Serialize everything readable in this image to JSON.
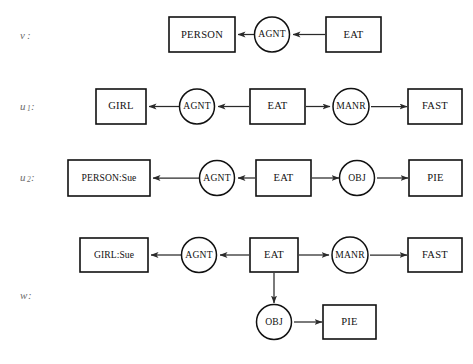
{
  "figure": {
    "background_color": "#ffffff",
    "stroke_color": "#111111",
    "text_color": "#111111",
    "label_color": "#6d6d6d",
    "width": 473,
    "height": 364
  },
  "rows": [
    {
      "id": "row-v",
      "label": "v",
      "label_sub": "",
      "label_colon": ":",
      "nodes": [
        {
          "id": "v-person",
          "shape": "box",
          "text": "PERSON"
        },
        {
          "id": "v-agnt",
          "shape": "circle",
          "text": "AGNT"
        },
        {
          "id": "v-eat",
          "shape": "box",
          "text": "EAT"
        }
      ],
      "edges": [
        {
          "from": "v-agnt",
          "to": "v-person",
          "direction": "left"
        },
        {
          "from": "v-eat",
          "to": "v-agnt",
          "direction": "left"
        }
      ]
    },
    {
      "id": "row-u1",
      "label": "u",
      "label_sub": "1",
      "label_colon": ":",
      "nodes": [
        {
          "id": "u1-girl",
          "shape": "box",
          "text": "GIRL"
        },
        {
          "id": "u1-agnt",
          "shape": "circle",
          "text": "AGNT"
        },
        {
          "id": "u1-eat",
          "shape": "box",
          "text": "EAT"
        },
        {
          "id": "u1-manr",
          "shape": "circle",
          "text": "MANR"
        },
        {
          "id": "u1-fast",
          "shape": "box",
          "text": "FAST"
        }
      ],
      "edges": [
        {
          "from": "u1-agnt",
          "to": "u1-girl",
          "direction": "left"
        },
        {
          "from": "u1-eat",
          "to": "u1-agnt",
          "direction": "left"
        },
        {
          "from": "u1-eat",
          "to": "u1-manr",
          "direction": "right"
        },
        {
          "from": "u1-manr",
          "to": "u1-fast",
          "direction": "right"
        }
      ]
    },
    {
      "id": "row-u2",
      "label": "u",
      "label_sub": "2",
      "label_colon": ":",
      "nodes": [
        {
          "id": "u2-person",
          "shape": "box",
          "text": "PERSON:Sue"
        },
        {
          "id": "u2-agnt",
          "shape": "circle",
          "text": "AGNT"
        },
        {
          "id": "u2-eat",
          "shape": "box",
          "text": "EAT"
        },
        {
          "id": "u2-obj",
          "shape": "circle",
          "text": "OBJ"
        },
        {
          "id": "u2-pie",
          "shape": "box",
          "text": "PIE"
        }
      ],
      "edges": [
        {
          "from": "u2-agnt",
          "to": "u2-person",
          "direction": "left"
        },
        {
          "from": "u2-eat",
          "to": "u2-agnt",
          "direction": "left"
        },
        {
          "from": "u2-eat",
          "to": "u2-obj",
          "direction": "right"
        },
        {
          "from": "u2-obj",
          "to": "u2-pie",
          "direction": "right"
        }
      ]
    },
    {
      "id": "row-w",
      "label": "w",
      "label_sub": "",
      "label_colon": ":",
      "nodes": [
        {
          "id": "w-girl",
          "shape": "box",
          "text": "GIRL:Sue"
        },
        {
          "id": "w-agnt",
          "shape": "circle",
          "text": "AGNT"
        },
        {
          "id": "w-eat",
          "shape": "box",
          "text": "EAT"
        },
        {
          "id": "w-manr",
          "shape": "circle",
          "text": "MANR"
        },
        {
          "id": "w-fast",
          "shape": "box",
          "text": "FAST"
        },
        {
          "id": "w-obj",
          "shape": "circle",
          "text": "OBJ"
        },
        {
          "id": "w-pie",
          "shape": "box",
          "text": "PIE"
        }
      ],
      "edges": [
        {
          "from": "w-agnt",
          "to": "w-girl",
          "direction": "left"
        },
        {
          "from": "w-eat",
          "to": "w-agnt",
          "direction": "left"
        },
        {
          "from": "w-eat",
          "to": "w-manr",
          "direction": "right"
        },
        {
          "from": "w-manr",
          "to": "w-fast",
          "direction": "right"
        },
        {
          "from": "w-eat",
          "to": "w-obj",
          "direction": "down"
        },
        {
          "from": "w-obj",
          "to": "w-pie",
          "direction": "right"
        }
      ]
    }
  ]
}
